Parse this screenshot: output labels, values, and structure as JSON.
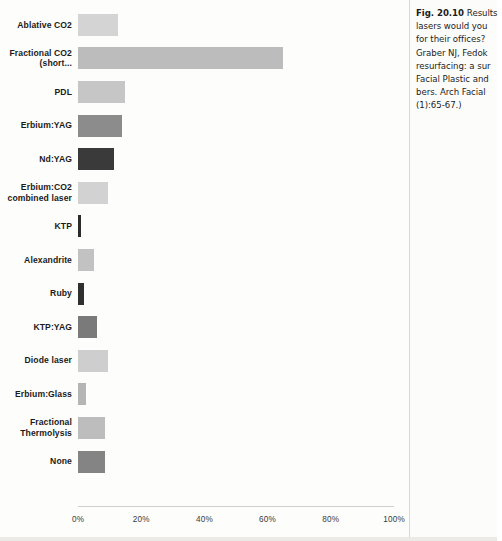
{
  "figure": {
    "number": "Fig. 20.10",
    "caption_lines": [
      "Results",
      "lasers would you",
      "for their offices?",
      "Graber NJ, Fedok",
      "resurfacing: a sur",
      "Facial Plastic and",
      "bers. Arch Facial",
      "(1):65-67.)"
    ]
  },
  "chart_data": {
    "type": "bar",
    "orientation": "horizontal",
    "title": "",
    "xlabel": "",
    "ylabel": "",
    "xlim": [
      0,
      100
    ],
    "grid": false,
    "legend": null,
    "xticks": [
      "0%",
      "20%",
      "40%",
      "60%",
      "80%",
      "100%"
    ],
    "xtick_values": [
      0,
      20,
      40,
      60,
      80,
      100
    ],
    "categories": [
      "Ablative CO2",
      "Fractional CO2 (short...",
      "PDL",
      "Erbium:YAG",
      "Nd:YAG",
      "Erbium:CO2 combined laser",
      "KTP",
      "Alexandrite",
      "Ruby",
      "KTP:YAG",
      "Diode laser",
      "Erbium:Glass",
      "Fractional Thermolysis",
      "None"
    ],
    "category_lines": [
      [
        "Ablative CO2"
      ],
      [
        "Fractional CO2",
        "(short..."
      ],
      [
        "PDL"
      ],
      [
        "Erbium:YAG"
      ],
      [
        "Nd:YAG"
      ],
      [
        "Erbium:CO2",
        "combined laser"
      ],
      [
        "KTP"
      ],
      [
        "Alexandrite"
      ],
      [
        "Ruby"
      ],
      [
        "KTP:YAG"
      ],
      [
        "Diode laser"
      ],
      [
        "Erbium:Glass"
      ],
      [
        "Fractional",
        "Thermolysis"
      ],
      [
        "None"
      ]
    ],
    "values": [
      12.5,
      65,
      15,
      14,
      11.5,
      9.5,
      1,
      5,
      2,
      6,
      9.5,
      2.5,
      8.5,
      8.5
    ],
    "bar_colors": [
      "#d4d4d4",
      "#bcbcbc",
      "#c6c6c6",
      "#8c8c8c",
      "#3a3a3a",
      "#d2d2d2",
      "#2b2b2b",
      "#c2c2c2",
      "#303030",
      "#7a7a7a",
      "#cecece",
      "#b5b5b5",
      "#bdbdbd",
      "#848484"
    ]
  }
}
